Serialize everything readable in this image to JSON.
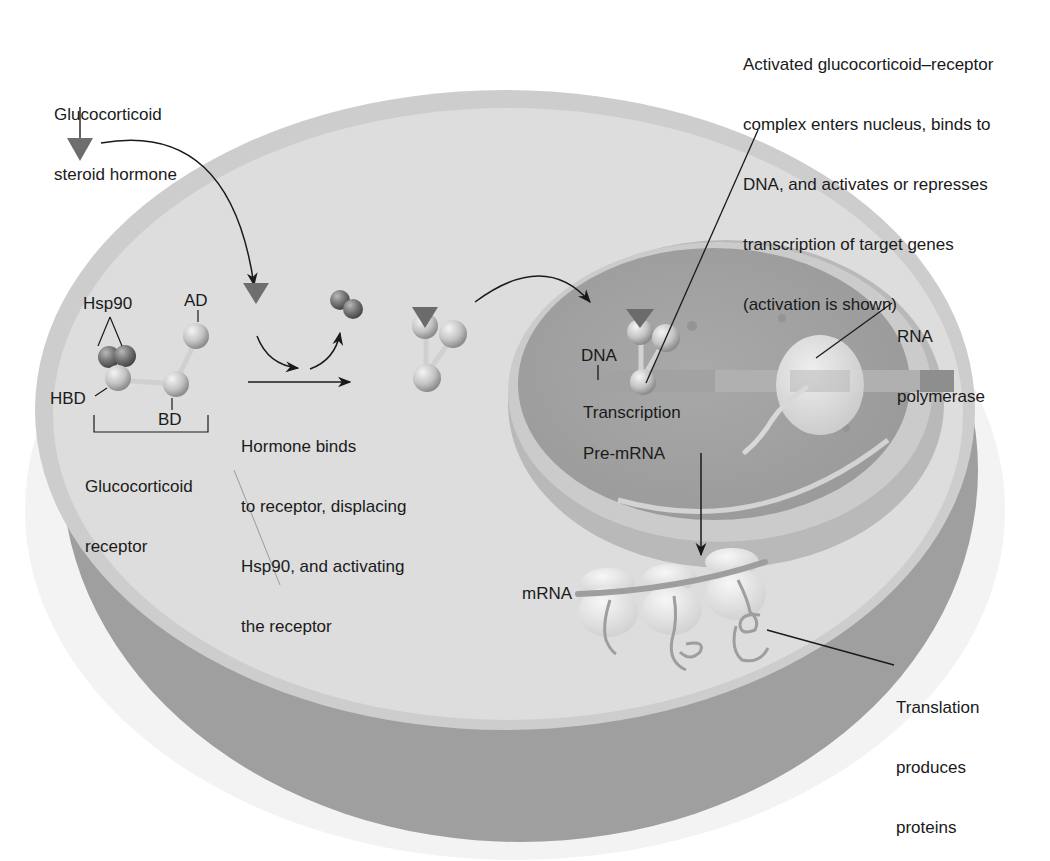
{
  "diagram": {
    "colors": {
      "background": "#ffffff",
      "cell_cytoplasm": "#dcdcdc",
      "cell_rim_light": "#cfcfcf",
      "cell_side_dark": "#9c9c9c",
      "nucleus_fill": "#a8a8a8",
      "nucleus_rim": "#c4c4c4",
      "hormone_triangle": "#6e6e6e",
      "hsp90_sphere": "#7d7d7d",
      "receptor_sphere": "#c9c9c9",
      "dna_bar": "#bdbdbd",
      "polymerase": "#e2e2e2",
      "ribosome": "#ececec",
      "mrna_strand": "#a0a0a0",
      "text": "#1a1a1a",
      "leader_line": "#1a1a1a"
    },
    "labels": {
      "hormone": [
        "Glucocorticoid",
        "steroid hormone"
      ],
      "activated_complex": [
        "Activated glucocorticoid–receptor",
        "complex enters nucleus, binds to",
        "DNA, and activates or represses",
        "transcription of target genes",
        "(activation is shown)"
      ],
      "hsp90": "Hsp90",
      "ad": "AD",
      "hbd": "HBD",
      "bd": "BD",
      "receptor": [
        "Glucocorticoid",
        "receptor"
      ],
      "hormone_binds": [
        "Hormone binds",
        "to receptor, displacing",
        "Hsp90, and activating",
        "the receptor"
      ],
      "dna": "DNA",
      "rna_polymerase": [
        "RNA",
        "polymerase"
      ],
      "transcription": "Transcription",
      "pre_mrna": "Pre-mRNA",
      "mrna": "mRNA",
      "translation": [
        "Translation",
        "produces",
        "proteins"
      ]
    },
    "steps": [
      {
        "id": 1,
        "name": "Hormone enters cell"
      },
      {
        "id": 2,
        "name": "Hormone binds receptor, Hsp90 displaced"
      },
      {
        "id": 3,
        "name": "Activated complex enters nucleus and binds DNA"
      },
      {
        "id": 4,
        "name": "Transcription produces pre-mRNA"
      },
      {
        "id": 5,
        "name": "mRNA translated into proteins"
      }
    ]
  }
}
